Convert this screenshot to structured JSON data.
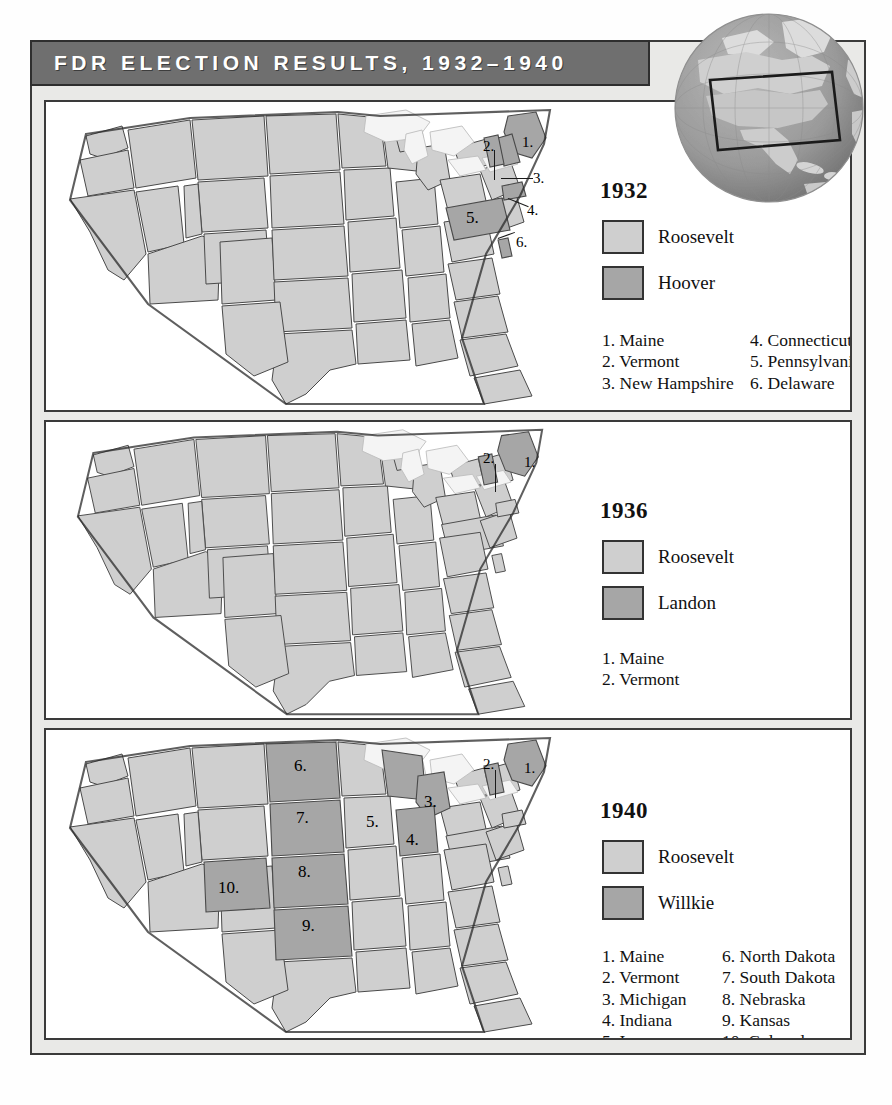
{
  "header": {
    "title": "FDR ELECTION RESULTS, 1932–1940",
    "bar_color": "#6f6f6f",
    "title_color": "#ffffff"
  },
  "globe": {
    "name": "globe-inset",
    "description": "North America globe with highlighted rectangle over the United States",
    "ocean_color": "#9a9a9a",
    "land_color": "#d8d8d8"
  },
  "colors": {
    "roosevelt": "#cfcfcf",
    "opponent": "#a6a6a6",
    "lakes": "#f2f2f2",
    "border": "#3a3a3a",
    "page": "#e9e9e7"
  },
  "maps": [
    {
      "id": "map-1932",
      "year": "1932",
      "legend": [
        {
          "label": "Roosevelt",
          "swatch": "light"
        },
        {
          "label": "Hoover",
          "swatch": "dark"
        }
      ],
      "key_left": [
        "1. Maine",
        "2. Vermont",
        "3. New Hampshire"
      ],
      "key_right": [
        "4. Connecticut",
        "5. Pennsylvania",
        "6. Delaware"
      ],
      "callouts": [
        "1.",
        "2.",
        "3.",
        "4.",
        "5.",
        "6."
      ],
      "opponent_states": [
        "Maine",
        "Vermont",
        "New Hampshire",
        "Connecticut",
        "Pennsylvania",
        "Delaware"
      ]
    },
    {
      "id": "map-1936",
      "year": "1936",
      "legend": [
        {
          "label": "Roosevelt",
          "swatch": "light"
        },
        {
          "label": "Landon",
          "swatch": "dark"
        }
      ],
      "key_left": [
        "1. Maine",
        "2. Vermont"
      ],
      "key_right": [],
      "callouts": [
        "1.",
        "2."
      ],
      "opponent_states": [
        "Maine",
        "Vermont"
      ]
    },
    {
      "id": "map-1940",
      "year": "1940",
      "legend": [
        {
          "label": "Roosevelt",
          "swatch": "light"
        },
        {
          "label": "Willkie",
          "swatch": "dark"
        }
      ],
      "key_left": [
        "1. Maine",
        "2. Vermont",
        "3. Michigan",
        "4. Indiana",
        "5. Iowa"
      ],
      "key_right": [
        "6. North Dakota",
        "7. South Dakota",
        "8. Nebraska",
        "9. Kansas",
        "10. Colorado"
      ],
      "callouts": [
        "1.",
        "2.",
        "3.",
        "4.",
        "5.",
        "6.",
        "7.",
        "8.",
        "9.",
        "10."
      ],
      "opponent_states": [
        "Maine",
        "Vermont",
        "Michigan",
        "Indiana",
        "Iowa",
        "North Dakota",
        "South Dakota",
        "Nebraska",
        "Kansas",
        "Colorado"
      ]
    }
  ]
}
